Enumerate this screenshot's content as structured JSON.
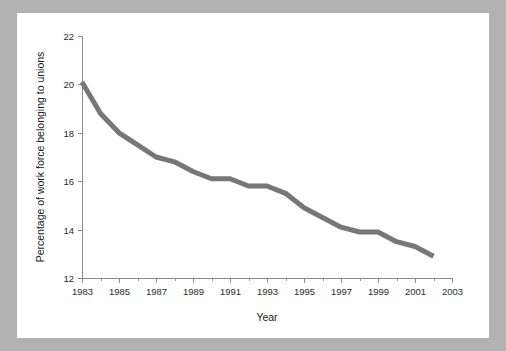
{
  "figure": {
    "background_color": "#b2b2b2",
    "panel_color": "#ffffff",
    "line_color": "#777777",
    "axis_color": "#8a8a8a",
    "text_color": "#1a1a1a"
  },
  "chart_data": {
    "type": "line",
    "title": "",
    "xlabel": "Year",
    "ylabel": "Percentage of work force belonging to unions",
    "xlim": [
      1983,
      2003
    ],
    "ylim": [
      12,
      22
    ],
    "grid": false,
    "legend": "none",
    "x_tick_labels": [
      "1983",
      "1985",
      "1987",
      "1989",
      "1991",
      "1993",
      "1995",
      "1997",
      "1999",
      "2001",
      "2003"
    ],
    "x_tick_values": [
      1983,
      1985,
      1987,
      1989,
      1991,
      1993,
      1995,
      1997,
      1999,
      2001,
      2003
    ],
    "x_minor_tick_values": [
      1984,
      1986,
      1988,
      1990,
      1992,
      1994,
      1996,
      1998,
      2000,
      2002
    ],
    "y_tick_labels": [
      "12",
      "14",
      "16",
      "18",
      "20",
      "22"
    ],
    "y_tick_values": [
      12,
      14,
      16,
      18,
      20,
      22
    ],
    "x": [
      1983,
      1984,
      1985,
      1986,
      1987,
      1988,
      1989,
      1990,
      1991,
      1992,
      1993,
      1994,
      1995,
      1996,
      1997,
      1998,
      1999,
      2000,
      2001,
      2002
    ],
    "values": [
      20.1,
      18.8,
      18.0,
      17.5,
      17.0,
      16.8,
      16.4,
      16.1,
      16.1,
      15.8,
      15.8,
      15.5,
      14.9,
      14.5,
      14.1,
      13.9,
      13.9,
      13.5,
      13.3,
      12.9
    ],
    "series": [
      {
        "name": "Union membership",
        "values": [
          20.1,
          18.8,
          18.0,
          17.5,
          17.0,
          16.8,
          16.4,
          16.1,
          16.1,
          15.8,
          15.8,
          15.5,
          14.9,
          14.5,
          14.1,
          13.9,
          13.9,
          13.5,
          13.3,
          12.9
        ]
      }
    ]
  }
}
